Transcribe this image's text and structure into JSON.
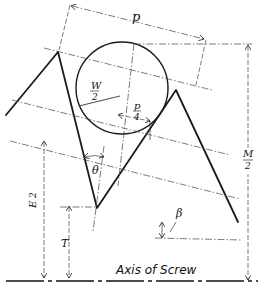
{
  "diagram": {
    "type": "screw thread measurement geometry (three-wire method)",
    "labels": {
      "pitch": "p",
      "wire_half": "W",
      "wire_half_den": "2",
      "quarter_pitch": "p",
      "quarter_pitch_den": "4",
      "angle": "θ",
      "effective_half": "E",
      "effective_half_den": "2",
      "measurement_half": "M",
      "measurement_half_den": "2",
      "root_height": "T",
      "helix_angle": "β",
      "axis": "Axis of Screw"
    }
  }
}
